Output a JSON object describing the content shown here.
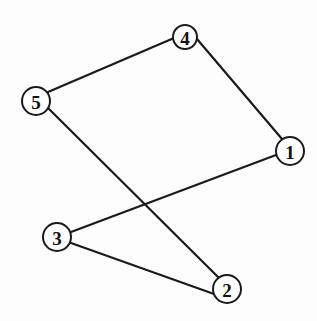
{
  "diagram": {
    "type": "undirected-graph",
    "nodes": [
      {
        "id": "1",
        "label": "1",
        "cx": 290,
        "cy": 151,
        "r": 14
      },
      {
        "id": "2",
        "label": "2",
        "cx": 227,
        "cy": 289,
        "r": 14
      },
      {
        "id": "3",
        "label": "3",
        "cx": 57,
        "cy": 237,
        "r": 14
      },
      {
        "id": "4",
        "label": "4",
        "cx": 185,
        "cy": 37,
        "r": 12
      },
      {
        "id": "5",
        "label": "5",
        "cx": 36,
        "cy": 101,
        "r": 14
      }
    ],
    "edges": [
      {
        "from": "5",
        "to": "4",
        "x1": 48,
        "y1": 92,
        "x2": 174,
        "y2": 38
      },
      {
        "from": "4",
        "to": "1",
        "x1": 197,
        "y1": 39,
        "x2": 282,
        "y2": 139
      },
      {
        "from": "5",
        "to": "2",
        "x1": 48,
        "y1": 108,
        "x2": 218,
        "y2": 277
      },
      {
        "from": "3",
        "to": "1",
        "x1": 71,
        "y1": 232,
        "x2": 276,
        "y2": 155
      },
      {
        "from": "3",
        "to": "2",
        "x1": 71,
        "y1": 243,
        "x2": 214,
        "y2": 294
      }
    ],
    "colors": {
      "stroke": "#1a1a1a",
      "background": "#fdfdfd"
    }
  }
}
